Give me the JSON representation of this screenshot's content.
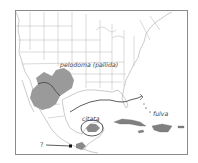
{
  "map": {
    "type": "species-distribution-map",
    "region": "Southern North America, Mexico, Central America and the Caribbean",
    "colors": {
      "background": "#ffffff",
      "frame": "#8a8a8a",
      "borders": "#a8a8a8",
      "range_fill": "#9a9a9a",
      "range_line": "#333333",
      "islands": "#808080"
    },
    "labels": [
      {
        "id": "pelodoma",
        "text": "pelodoma (pallida)",
        "x": 60,
        "y": 67
      },
      {
        "id": "citata",
        "text": "citata",
        "x": 82,
        "y": 121
      },
      {
        "id": "fulva",
        "text": "fulva",
        "x": 153,
        "y": 116
      },
      {
        "id": "unknown",
        "text": "?",
        "x": 40,
        "y": 147
      }
    ],
    "ranges": [
      {
        "id": "pelodoma-range",
        "label": "pelodoma (pallida)",
        "style": "shaded area, Texas & northern Mexico"
      },
      {
        "id": "citata-range",
        "label": "citata",
        "style": "shaded area circled, Yucatan Peninsula"
      },
      {
        "id": "fulva-range",
        "label": "fulva",
        "style": "line boundary across Gulf to Florida / Caribbean islands"
      },
      {
        "id": "unknown-record",
        "label": "?",
        "style": "arrow to point in southern Mexico"
      }
    ]
  }
}
